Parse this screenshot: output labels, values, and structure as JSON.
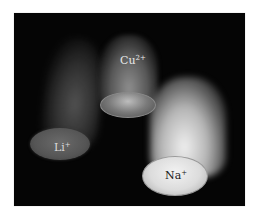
{
  "image": {
    "description": "Flame test: three dishes with flames labeled by ion",
    "background_color": "#050505",
    "samples": [
      {
        "id": "li",
        "ion": "Li",
        "charge": "+",
        "flame_tone": "#5f5f5f"
      },
      {
        "id": "cu",
        "ion": "Cu",
        "charge": "2+",
        "flame_tone": "#969696"
      },
      {
        "id": "na",
        "ion": "Na",
        "charge": "+",
        "flame_tone": "#f0f0f0"
      }
    ]
  }
}
